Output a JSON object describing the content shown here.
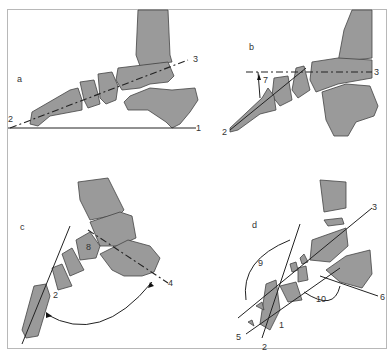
{
  "figure": {
    "panels": [
      {
        "id": "a",
        "label": "a",
        "line_labels": [
          "1",
          "2",
          "3"
        ]
      },
      {
        "id": "b",
        "label": "b",
        "line_labels": [
          "2",
          "3"
        ],
        "angle_label": "7"
      },
      {
        "id": "c",
        "label": "c",
        "line_labels": [
          "2",
          "4"
        ],
        "angle_label": "8"
      },
      {
        "id": "d",
        "label": "d",
        "line_labels": [
          "1",
          "2",
          "3",
          "5",
          "6"
        ],
        "angle_labels": [
          "9",
          "10"
        ]
      }
    ]
  },
  "colors": {
    "bone": "#9a9a9a",
    "outline": "#444444",
    "frame": "#b8b8b8",
    "line": "#222222"
  }
}
